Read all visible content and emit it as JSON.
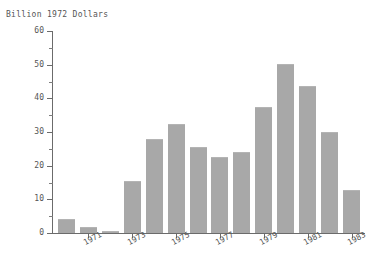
{
  "chart_data": {
    "type": "bar",
    "title": "Billion 1972 Dollars",
    "xlabel": "",
    "ylabel": "Billion 1972 Dollars",
    "ylim": [
      0,
      60
    ],
    "xlim": [
      1969.4,
      1983.6
    ],
    "grid": false,
    "legend": null,
    "y_ticks_major": [
      0,
      10,
      20,
      30,
      40,
      50,
      60
    ],
    "y_tick_labels": [
      "0",
      "10",
      "20",
      "30",
      "40",
      "50",
      "60"
    ],
    "y_ticks_minor": [
      5,
      15,
      25,
      35,
      45,
      55
    ],
    "x_tick_labels": [
      "1971",
      "1973",
      "1975",
      "1977",
      "1979",
      "1981",
      "1983"
    ],
    "x_tick_values": [
      1971,
      1973,
      1975,
      1977,
      1979,
      1981,
      1983
    ],
    "x_label_rotation_deg": -28,
    "bar_color": "#a8a8a8",
    "axis_color": "#6b6b6b",
    "text_color": "#555555",
    "background_color": "#ffffff",
    "categories": [
      1970,
      1971,
      1972,
      1973,
      1974,
      1975,
      1976,
      1977,
      1978,
      1979,
      1980,
      1981,
      1982,
      1983
    ],
    "values": [
      4.2,
      1.8,
      0.7,
      15.5,
      28.0,
      32.5,
      25.5,
      22.5,
      24.0,
      37.5,
      50.3,
      43.8,
      30.0,
      12.7
    ]
  }
}
